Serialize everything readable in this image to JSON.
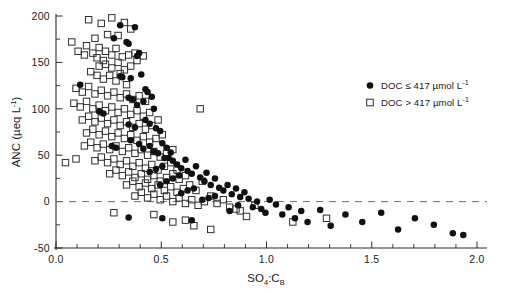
{
  "chart_data": {
    "type": "scatter",
    "title": "",
    "xlabel": "SO4:CB",
    "xlabel_parts": {
      "main1": "SO",
      "sub1": "4",
      "mid": ":C",
      "sub2": "B"
    },
    "ylabel": "ANC (µeq L⁻¹)",
    "ylabel_parts": {
      "main": "ANC (",
      "mu": "µ",
      "unit": "eq L",
      "sup": "-1",
      "close": ")"
    },
    "xlim": [
      0.0,
      2.0
    ],
    "ylim": [
      -50,
      200
    ],
    "xticks": [
      0.0,
      0.5,
      1.0,
      1.5,
      2.0
    ],
    "xticklabels": [
      "0.0",
      "0.5",
      "1.0",
      "1.5",
      "2.0"
    ],
    "yticks": [
      -50,
      0,
      50,
      100,
      150,
      200
    ],
    "yticklabels": [
      "-50",
      "0",
      "50",
      "100",
      "150",
      "200"
    ],
    "x_minor_step": 0.1,
    "y_minor_step": 25,
    "grid": false,
    "reference_lines": [
      {
        "axis": "y",
        "value": 0,
        "style": "dashed",
        "color": "#6f6f6f"
      }
    ],
    "legend_position": "upper-right",
    "marker_colors": {
      "filled": "#111111",
      "open_stroke": "#2f2f2f"
    },
    "series": [
      {
        "name": "DOC ≤ 417 µmol L⁻¹",
        "marker": "filled-circle",
        "legend_label_parts": {
          "text": "DOC ≤ 417 ",
          "mu": "µ",
          "unit": "mol L",
          "sup": "-1"
        },
        "points": [
          [
            0.305,
            190
          ],
          [
            0.375,
            188
          ],
          [
            0.275,
            176
          ],
          [
            0.335,
            172
          ],
          [
            0.345,
            170
          ],
          [
            0.115,
            126
          ],
          [
            0.305,
            135
          ],
          [
            0.315,
            134
          ],
          [
            0.355,
            133
          ],
          [
            0.405,
            137
          ],
          [
            0.395,
            160
          ],
          [
            0.385,
            157
          ],
          [
            0.425,
            121
          ],
          [
            0.205,
            97
          ],
          [
            0.225,
            95
          ],
          [
            0.345,
            112
          ],
          [
            0.365,
            110
          ],
          [
            0.415,
            108
          ],
          [
            0.435,
            118
          ],
          [
            0.455,
            113
          ],
          [
            0.385,
            104
          ],
          [
            0.465,
            100
          ],
          [
            0.345,
            83
          ],
          [
            0.375,
            80
          ],
          [
            0.425,
            88
          ],
          [
            0.445,
            84
          ],
          [
            0.475,
            79
          ],
          [
            0.495,
            76
          ],
          [
            0.265,
            60
          ],
          [
            0.285,
            58
          ],
          [
            0.355,
            66
          ],
          [
            0.395,
            62
          ],
          [
            0.415,
            57
          ],
          [
            0.445,
            60
          ],
          [
            0.465,
            54
          ],
          [
            0.485,
            52
          ],
          [
            0.505,
            63
          ],
          [
            0.525,
            58
          ],
          [
            0.535,
            47
          ],
          [
            0.555,
            44
          ],
          [
            0.505,
            38
          ],
          [
            0.475,
            35
          ],
          [
            0.445,
            32
          ],
          [
            0.575,
            40
          ],
          [
            0.595,
            36
          ],
          [
            0.615,
            45
          ],
          [
            0.625,
            33
          ],
          [
            0.645,
            30
          ],
          [
            0.665,
            38
          ],
          [
            0.585,
            28
          ],
          [
            0.555,
            25
          ],
          [
            0.525,
            22
          ],
          [
            0.495,
            18
          ],
          [
            0.685,
            26
          ],
          [
            0.705,
            22
          ],
          [
            0.715,
            31
          ],
          [
            0.735,
            18
          ],
          [
            0.755,
            25
          ],
          [
            0.775,
            15
          ],
          [
            0.655,
            14
          ],
          [
            0.625,
            12
          ],
          [
            0.595,
            9
          ],
          [
            0.795,
            12
          ],
          [
            0.815,
            18
          ],
          [
            0.835,
            8
          ],
          [
            0.855,
            14
          ],
          [
            0.875,
            5
          ],
          [
            0.895,
            10
          ],
          [
            0.755,
            6
          ],
          [
            0.725,
            4
          ],
          [
            0.695,
            2
          ],
          [
            0.915,
            3
          ],
          [
            0.935,
            -6
          ],
          [
            0.955,
            0
          ],
          [
            0.975,
            -8
          ],
          [
            0.865,
            -4
          ],
          [
            0.825,
            -10
          ],
          [
            0.995,
            -12
          ],
          [
            1.015,
            2
          ],
          [
            1.045,
            -3
          ],
          [
            1.075,
            -14
          ],
          [
            1.105,
            -6
          ],
          [
            1.135,
            -18
          ],
          [
            1.165,
            -10
          ],
          [
            1.195,
            -22
          ],
          [
            0.345,
            -17
          ],
          [
            0.505,
            -18
          ],
          [
            0.645,
            -20
          ],
          [
            1.255,
            -9
          ],
          [
            1.305,
            -26
          ],
          [
            1.375,
            -14
          ],
          [
            1.455,
            -22
          ],
          [
            1.545,
            -12
          ],
          [
            1.625,
            -30
          ],
          [
            1.705,
            -18
          ],
          [
            1.795,
            -25
          ],
          [
            1.885,
            -34
          ],
          [
            1.935,
            -36
          ],
          [
            0.515,
            47
          ],
          [
            0.545,
            53
          ]
        ]
      },
      {
        "name": "DOC > 417 µmol L⁻¹",
        "marker": "open-square",
        "legend_label_parts": {
          "text": "DOC > 417 ",
          "mu": "µ",
          "unit": "mol L",
          "sup": "-1"
        },
        "points": [
          [
            0.155,
            196
          ],
          [
            0.265,
            198
          ],
          [
            0.215,
            192
          ],
          [
            0.325,
            193
          ],
          [
            0.355,
            186
          ],
          [
            0.075,
            172
          ],
          [
            0.145,
            168
          ],
          [
            0.185,
            176
          ],
          [
            0.245,
            180
          ],
          [
            0.295,
            179
          ],
          [
            0.105,
            162
          ],
          [
            0.135,
            158
          ],
          [
            0.175,
            160
          ],
          [
            0.205,
            166
          ],
          [
            0.235,
            162
          ],
          [
            0.265,
            158
          ],
          [
            0.285,
            165
          ],
          [
            0.315,
            156
          ],
          [
            0.345,
            158
          ],
          [
            0.375,
            160
          ],
          [
            0.385,
            152
          ],
          [
            0.415,
            157
          ],
          [
            0.205,
            146
          ],
          [
            0.235,
            148
          ],
          [
            0.265,
            144
          ],
          [
            0.295,
            150
          ],
          [
            0.325,
            142
          ],
          [
            0.355,
            146
          ],
          [
            0.165,
            140
          ],
          [
            0.195,
            136
          ],
          [
            0.225,
            132
          ],
          [
            0.255,
            136
          ],
          [
            0.285,
            130
          ],
          [
            0.305,
            138
          ],
          [
            0.335,
            126
          ],
          [
            0.095,
            122
          ],
          [
            0.125,
            118
          ],
          [
            0.155,
            124
          ],
          [
            0.185,
            116
          ],
          [
            0.215,
            120
          ],
          [
            0.245,
            114
          ],
          [
            0.275,
            118
          ],
          [
            0.305,
            112
          ],
          [
            0.335,
            116
          ],
          [
            0.365,
            110
          ],
          [
            0.395,
            114
          ],
          [
            0.425,
            108
          ],
          [
            0.085,
            106
          ],
          [
            0.115,
            102
          ],
          [
            0.145,
            108
          ],
          [
            0.175,
            100
          ],
          [
            0.205,
            104
          ],
          [
            0.235,
            98
          ],
          [
            0.265,
            102
          ],
          [
            0.295,
            96
          ],
          [
            0.325,
            100
          ],
          [
            0.355,
            94
          ],
          [
            0.385,
            98
          ],
          [
            0.415,
            92
          ],
          [
            0.445,
            96
          ],
          [
            0.685,
            100
          ],
          [
            0.125,
            88
          ],
          [
            0.155,
            92
          ],
          [
            0.185,
            86
          ],
          [
            0.215,
            90
          ],
          [
            0.245,
            84
          ],
          [
            0.275,
            88
          ],
          [
            0.305,
            82
          ],
          [
            0.335,
            86
          ],
          [
            0.365,
            80
          ],
          [
            0.395,
            84
          ],
          [
            0.425,
            78
          ],
          [
            0.455,
            82
          ],
          [
            0.485,
            88
          ],
          [
            0.145,
            74
          ],
          [
            0.175,
            78
          ],
          [
            0.205,
            72
          ],
          [
            0.235,
            76
          ],
          [
            0.265,
            70
          ],
          [
            0.295,
            74
          ],
          [
            0.325,
            68
          ],
          [
            0.355,
            72
          ],
          [
            0.385,
            66
          ],
          [
            0.415,
            70
          ],
          [
            0.445,
            64
          ],
          [
            0.475,
            68
          ],
          [
            0.505,
            72
          ],
          [
            0.135,
            60
          ],
          [
            0.165,
            64
          ],
          [
            0.195,
            58
          ],
          [
            0.225,
            62
          ],
          [
            0.255,
            56
          ],
          [
            0.285,
            60
          ],
          [
            0.315,
            54
          ],
          [
            0.345,
            58
          ],
          [
            0.375,
            52
          ],
          [
            0.405,
            56
          ],
          [
            0.435,
            50
          ],
          [
            0.465,
            54
          ],
          [
            0.495,
            48
          ],
          [
            0.525,
            52
          ],
          [
            0.555,
            56
          ],
          [
            0.045,
            42
          ],
          [
            0.095,
            46
          ],
          [
            0.185,
            44
          ],
          [
            0.215,
            48
          ],
          [
            0.245,
            42
          ],
          [
            0.275,
            46
          ],
          [
            0.305,
            40
          ],
          [
            0.335,
            44
          ],
          [
            0.365,
            38
          ],
          [
            0.395,
            42
          ],
          [
            0.425,
            36
          ],
          [
            0.455,
            40
          ],
          [
            0.485,
            34
          ],
          [
            0.515,
            38
          ],
          [
            0.545,
            42
          ],
          [
            0.575,
            34
          ],
          [
            0.255,
            30
          ],
          [
            0.285,
            34
          ],
          [
            0.315,
            28
          ],
          [
            0.345,
            32
          ],
          [
            0.375,
            26
          ],
          [
            0.405,
            30
          ],
          [
            0.435,
            24
          ],
          [
            0.465,
            28
          ],
          [
            0.495,
            22
          ],
          [
            0.525,
            26
          ],
          [
            0.555,
            30
          ],
          [
            0.585,
            24
          ],
          [
            0.615,
            28
          ],
          [
            0.335,
            18
          ],
          [
            0.365,
            22
          ],
          [
            0.395,
            16
          ],
          [
            0.425,
            20
          ],
          [
            0.455,
            14
          ],
          [
            0.485,
            18
          ],
          [
            0.515,
            12
          ],
          [
            0.545,
            16
          ],
          [
            0.575,
            10
          ],
          [
            0.605,
            14
          ],
          [
            0.635,
            18
          ],
          [
            0.665,
            12
          ],
          [
            0.695,
            22
          ],
          [
            0.375,
            6
          ],
          [
            0.405,
            10
          ],
          [
            0.435,
            4
          ],
          [
            0.465,
            8
          ],
          [
            0.495,
            2
          ],
          [
            0.525,
            6
          ],
          [
            0.555,
            0
          ],
          [
            0.585,
            4
          ],
          [
            0.615,
            -2
          ],
          [
            0.645,
            2
          ],
          [
            0.675,
            -4
          ],
          [
            0.705,
            0
          ],
          [
            0.735,
            6
          ],
          [
            0.765,
            -2
          ],
          [
            0.795,
            2
          ],
          [
            0.825,
            -6
          ],
          [
            0.465,
            -14
          ],
          [
            0.555,
            -22
          ],
          [
            0.615,
            -20
          ],
          [
            0.655,
            -26
          ],
          [
            0.875,
            -10
          ],
          [
            0.905,
            -16
          ],
          [
            0.275,
            -12
          ],
          [
            0.945,
            -4
          ],
          [
            1.125,
            -22
          ],
          [
            1.285,
            -18
          ],
          [
            0.735,
            -30
          ],
          [
            0.855,
            -8
          ],
          [
            0.225,
            152
          ],
          [
            0.195,
            155
          ]
        ]
      }
    ]
  },
  "geometry": {
    "x0_px": 56,
    "x1_px": 477,
    "y_top_px": 16,
    "y_bottom_px": 248,
    "x_val_min": 0.0,
    "x_val_max": 2.0,
    "y_val_min": -50,
    "y_val_max": 200,
    "zero_dash_end_px": 487
  },
  "legend": {
    "x_marker_px": 370,
    "x_text_px": 381,
    "row1_y_px": 89,
    "row2_y_px": 106
  }
}
